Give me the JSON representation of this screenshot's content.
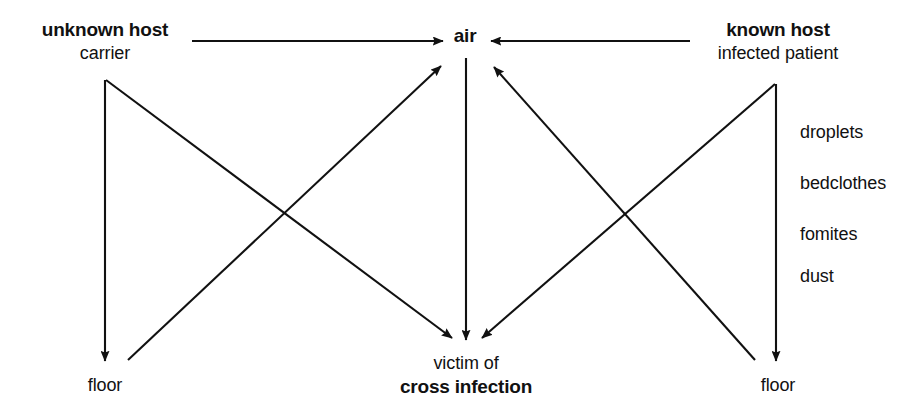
{
  "diagram": {
    "background_color": "#ffffff",
    "ink_color": "#111111",
    "nodes": [
      {
        "id": "unknown-host",
        "strong_label": "unknown host",
        "plain_label": "carrier",
        "x": 105,
        "y": 18
      },
      {
        "id": "air",
        "strong_label": "air",
        "plain_label": "",
        "x": 465,
        "y": 24
      },
      {
        "id": "known-host",
        "strong_label": "known host",
        "plain_label": "infected patient",
        "x": 778,
        "y": 18
      },
      {
        "id": "floor-left",
        "strong_label": "",
        "plain_label": "floor",
        "x": 105,
        "y": 374
      },
      {
        "id": "victim",
        "strong_label": "cross infection",
        "plain_label": "victim of",
        "x": 466,
        "y": 352
      },
      {
        "id": "floor-right",
        "strong_label": "",
        "plain_label": "floor",
        "x": 778,
        "y": 374
      }
    ],
    "vector_labels": [
      {
        "id": "droplets",
        "text": "droplets",
        "x": 800,
        "y": 122
      },
      {
        "id": "bedclothes",
        "text": "bedclothes",
        "x": 800,
        "y": 173
      },
      {
        "id": "fomites",
        "text": "fomites",
        "x": 800,
        "y": 224
      },
      {
        "id": "dust",
        "text": "dust",
        "x": 800,
        "y": 266
      }
    ],
    "edges": [
      {
        "id": "unknown-host-to-air",
        "from": "unknown host",
        "to": "air",
        "x1": 192,
        "y1": 41,
        "x2": 443,
        "y2": 41,
        "arrow": "end"
      },
      {
        "id": "known-host-to-air",
        "from": "known host",
        "to": "air",
        "x1": 690,
        "y1": 41,
        "x2": 491,
        "y2": 41,
        "arrow": "end"
      },
      {
        "id": "unknown-host-to-floor-left",
        "from": "unknown host",
        "to": "floor",
        "x1": 105,
        "y1": 80,
        "x2": 105,
        "y2": 361,
        "arrow": "end"
      },
      {
        "id": "unknown-host-to-victim",
        "from": "unknown host",
        "to": "victim of cross infection",
        "x1": 106,
        "y1": 80,
        "x2": 452,
        "y2": 338,
        "arrow": "end"
      },
      {
        "id": "floor-left-to-air",
        "from": "floor",
        "to": "air",
        "x1": 128,
        "y1": 360,
        "x2": 441,
        "y2": 66,
        "arrow": "end"
      },
      {
        "id": "air-to-victim",
        "from": "air",
        "to": "victim of cross infection",
        "x1": 466,
        "y1": 58,
        "x2": 466,
        "y2": 340,
        "arrow": "end"
      },
      {
        "id": "known-host-to-floor-right",
        "from": "known host",
        "to": "floor",
        "x1": 776,
        "y1": 84,
        "x2": 776,
        "y2": 361,
        "arrow": "end"
      },
      {
        "id": "known-host-to-victim",
        "from": "known host",
        "to": "victim of cross infection",
        "x1": 775,
        "y1": 84,
        "x2": 482,
        "y2": 338,
        "arrow": "end"
      },
      {
        "id": "floor-right-to-air",
        "from": "floor",
        "to": "air",
        "x1": 755,
        "y1": 360,
        "x2": 494,
        "y2": 67,
        "arrow": "end"
      }
    ]
  }
}
